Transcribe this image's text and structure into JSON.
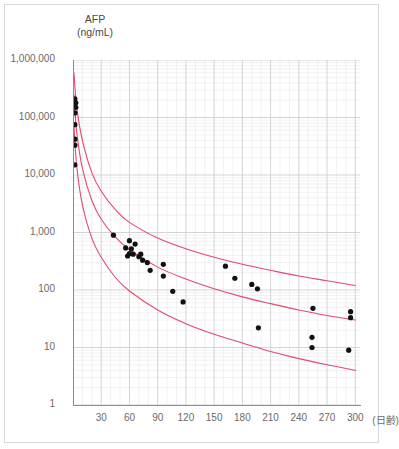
{
  "chart_data": {
    "type": "scatter",
    "title_line1": "AFP",
    "title_line2": "(ng/mL)",
    "ylabel": "AFP (ng/mL)",
    "xlabel": "(日齢)",
    "xunit_label": "(日齢)",
    "yscale": "log",
    "ylim": [
      1,
      1000000
    ],
    "xlim": [
      0,
      305
    ],
    "grid": true,
    "grid_minor": true,
    "legend": "none",
    "ytick_labels": [
      "1,000,000",
      "100,000",
      "10,000",
      "1,000",
      "100",
      "10",
      "1"
    ],
    "ytick_values": [
      1000000,
      100000,
      10000,
      1000,
      100,
      10,
      1
    ],
    "xtick_labels": [
      "30",
      "60",
      "90",
      "120",
      "150",
      "180",
      "210",
      "240",
      "270",
      "300"
    ],
    "xtick_values": [
      30,
      60,
      90,
      120,
      150,
      180,
      210,
      240,
      270,
      300
    ],
    "accent_color": "#e24a6e",
    "point_color": "#111111",
    "grid_color": "#dcdcdc",
    "axis_color": "#9a9a9a",
    "series": [
      {
        "name": "AFP measurements",
        "type": "scatter",
        "points": [
          {
            "x": 2,
            "y": 210000
          },
          {
            "x": 3,
            "y": 180000
          },
          {
            "x": 3,
            "y": 150000
          },
          {
            "x": 2,
            "y": 120000
          },
          {
            "x": 2,
            "y": 75000
          },
          {
            "x": 2,
            "y": 42000
          },
          {
            "x": 2,
            "y": 33000
          },
          {
            "x": 2,
            "y": 15000
          },
          {
            "x": 43,
            "y": 900
          },
          {
            "x": 60,
            "y": 720
          },
          {
            "x": 66,
            "y": 630
          },
          {
            "x": 56,
            "y": 540
          },
          {
            "x": 62,
            "y": 520
          },
          {
            "x": 60,
            "y": 430
          },
          {
            "x": 64,
            "y": 420
          },
          {
            "x": 72,
            "y": 420
          },
          {
            "x": 58,
            "y": 390
          },
          {
            "x": 70,
            "y": 380
          },
          {
            "x": 74,
            "y": 330
          },
          {
            "x": 79,
            "y": 300
          },
          {
            "x": 96,
            "y": 280
          },
          {
            "x": 82,
            "y": 220
          },
          {
            "x": 162,
            "y": 260
          },
          {
            "x": 96,
            "y": 175
          },
          {
            "x": 172,
            "y": 160
          },
          {
            "x": 190,
            "y": 125
          },
          {
            "x": 196,
            "y": 105
          },
          {
            "x": 106,
            "y": 95
          },
          {
            "x": 117,
            "y": 62
          },
          {
            "x": 255,
            "y": 48
          },
          {
            "x": 295,
            "y": 42
          },
          {
            "x": 295,
            "y": 33
          },
          {
            "x": 197,
            "y": 22
          },
          {
            "x": 254,
            "y": 15
          },
          {
            "x": 254,
            "y": 10
          },
          {
            "x": 293,
            "y": 9
          }
        ]
      }
    ],
    "reference_curves": [
      {
        "name": "upper-reference-curve",
        "color": "#e24a6e",
        "points": [
          {
            "x": 1,
            "y": 600000
          },
          {
            "x": 4,
            "y": 150000
          },
          {
            "x": 10,
            "y": 40000
          },
          {
            "x": 20,
            "y": 11000
          },
          {
            "x": 30,
            "y": 5200
          },
          {
            "x": 45,
            "y": 2500
          },
          {
            "x": 60,
            "y": 1500
          },
          {
            "x": 90,
            "y": 800
          },
          {
            "x": 120,
            "y": 520
          },
          {
            "x": 150,
            "y": 370
          },
          {
            "x": 180,
            "y": 280
          },
          {
            "x": 210,
            "y": 220
          },
          {
            "x": 240,
            "y": 175
          },
          {
            "x": 270,
            "y": 145
          },
          {
            "x": 300,
            "y": 120
          }
        ]
      },
      {
        "name": "median-reference-curve",
        "color": "#e24a6e",
        "points": [
          {
            "x": 1,
            "y": 250000
          },
          {
            "x": 4,
            "y": 55000
          },
          {
            "x": 10,
            "y": 13000
          },
          {
            "x": 20,
            "y": 3600
          },
          {
            "x": 30,
            "y": 1700
          },
          {
            "x": 45,
            "y": 830
          },
          {
            "x": 60,
            "y": 500
          },
          {
            "x": 90,
            "y": 250
          },
          {
            "x": 120,
            "y": 155
          },
          {
            "x": 150,
            "y": 105
          },
          {
            "x": 180,
            "y": 76
          },
          {
            "x": 210,
            "y": 58
          },
          {
            "x": 240,
            "y": 45
          },
          {
            "x": 270,
            "y": 36
          },
          {
            "x": 300,
            "y": 30
          }
        ]
      },
      {
        "name": "lower-reference-curve",
        "color": "#e24a6e",
        "points": [
          {
            "x": 1,
            "y": 70000
          },
          {
            "x": 4,
            "y": 14000
          },
          {
            "x": 10,
            "y": 3000
          },
          {
            "x": 20,
            "y": 800
          },
          {
            "x": 30,
            "y": 370
          },
          {
            "x": 45,
            "y": 165
          },
          {
            "x": 60,
            "y": 96
          },
          {
            "x": 90,
            "y": 45
          },
          {
            "x": 120,
            "y": 26
          },
          {
            "x": 150,
            "y": 17
          },
          {
            "x": 180,
            "y": 12
          },
          {
            "x": 210,
            "y": 8.5
          },
          {
            "x": 240,
            "y": 6.4
          },
          {
            "x": 270,
            "y": 5.0
          },
          {
            "x": 300,
            "y": 4.0
          }
        ]
      }
    ]
  }
}
